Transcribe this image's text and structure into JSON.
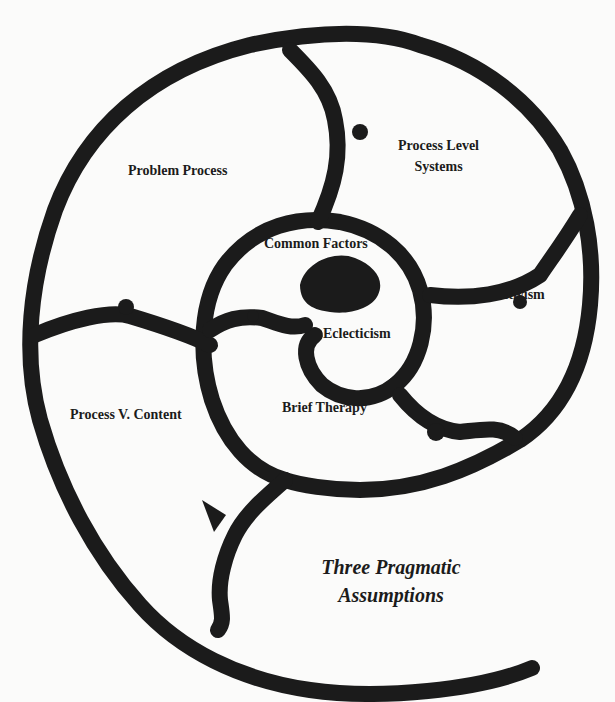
{
  "diagram": {
    "type": "nautilus-spiral",
    "stroke_color": "#1b1b1b",
    "background_color": "#fbfbfa",
    "title_lines": [
      "Three Pragmatic",
      "Assumptions"
    ],
    "chambers": [
      {
        "id": "problem-process",
        "lines": [
          "Problem Process"
        ]
      },
      {
        "id": "process-level-systems",
        "lines": [
          "Process Level",
          "Systems"
        ]
      },
      {
        "id": "common-factors",
        "lines": [
          "Common Factors"
        ]
      },
      {
        "id": "constructivism",
        "lines": [
          "Constructivism"
        ]
      },
      {
        "id": "eclecticism",
        "lines": [
          "Eclecticism"
        ]
      },
      {
        "id": "process-v-content",
        "lines": [
          "Process V. Content"
        ]
      },
      {
        "id": "brief-therapy",
        "lines": [
          "Brief Therapy"
        ]
      }
    ]
  }
}
